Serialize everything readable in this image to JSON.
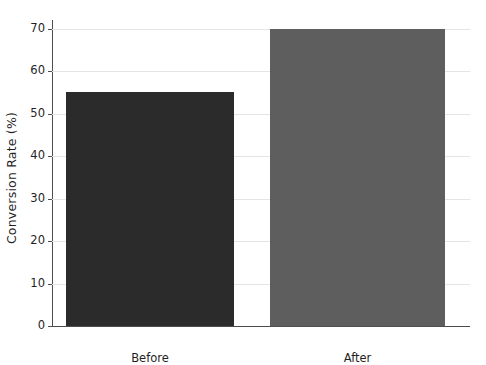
{
  "chart_data": {
    "type": "bar",
    "title": "",
    "subtitle": "",
    "xlabel": "",
    "ylabel": "Conversion Rate (%)",
    "categories": [
      "Before",
      "After"
    ],
    "values": [
      55,
      70
    ],
    "series": [
      {
        "name": "Conversion Rate",
        "values": [
          55,
          70
        ]
      }
    ],
    "ylim": [
      0,
      72
    ],
    "yticks": [
      0,
      10,
      20,
      30,
      40,
      50,
      60,
      70
    ],
    "ytick_labels": [
      "0",
      "10",
      "20",
      "30",
      "40",
      "50",
      "60",
      "70"
    ],
    "xticks": [
      "Before",
      "After"
    ],
    "grid": true,
    "grid_axis": "y",
    "legend": false,
    "legend_position": "none",
    "annotations": [],
    "bar_colors": [
      "#2b2b2b",
      "#5e5e5e"
    ],
    "background_color": "#ffffff",
    "grid_color": "#e4e4e6",
    "axis_color": "#4d4d4d",
    "text_color": "#1f1f1f"
  }
}
